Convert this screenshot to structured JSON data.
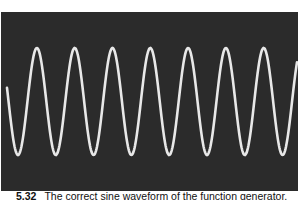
{
  "figure": {
    "number": "5.32",
    "caption": "The correct sine waveform of the function generator."
  },
  "oscilloscope": {
    "background_color": "#2b2b2b",
    "trace_color": "#e8e8e8",
    "waveform": "sine"
  }
}
